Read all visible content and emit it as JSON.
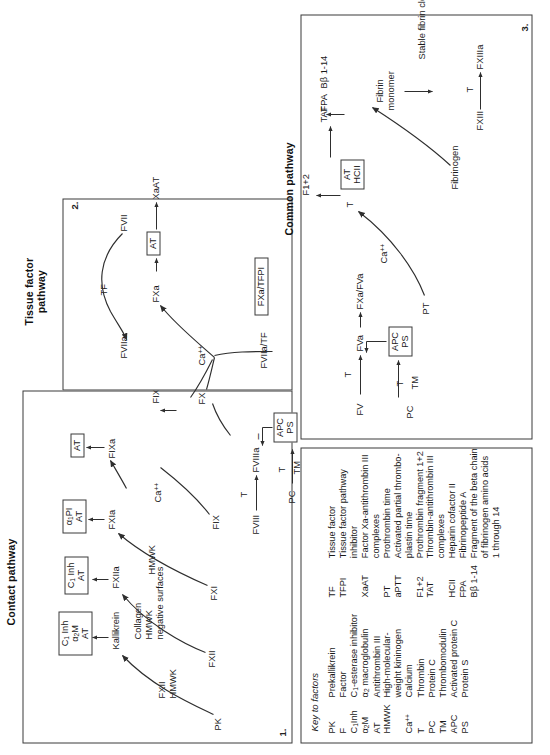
{
  "figure": {
    "title_contact": "Contact pathway",
    "title_tissue": "Tissue factor pathway",
    "title_common": "Common pathway",
    "panel_numbers": {
      "contact": "1.",
      "tissue": "2.",
      "common": "3."
    }
  },
  "contact_pathway": {
    "nodes": {
      "pk": "PK",
      "fxii_hmwk": "FXII\nHMWK",
      "kallikrein": "Kallikrein",
      "fxii": "FXII",
      "collagen_hmwk_surfaces": "Collagen\nHMWK\nnegative surfaces",
      "fxiia": "FXIIa",
      "hmwk": "HMWK",
      "fxi": "FXI",
      "fxia": "FXIa",
      "ca": "Ca",
      "ca_charge": "++",
      "fix": "FIX",
      "fixa": "FIXa",
      "fviii": "FVIII",
      "fviiia": "FVIIIa",
      "t1": "T",
      "pc": "PC",
      "t2": "T",
      "tm": "TM",
      "minus": "–",
      "fixa_fviiia": "FIXa/FVIIIa"
    },
    "inhibitor_boxes": {
      "kallikrein_inh": [
        "C₁ Inh",
        "α₂M",
        "AT"
      ],
      "fxiia_inh": [
        "C₁ Inh",
        "AT"
      ],
      "fxia_inh": [
        "α₁PI",
        "AT"
      ],
      "fixa_inh": [
        "AT"
      ],
      "apc_ps": [
        "APC",
        "PS"
      ]
    }
  },
  "tissue_factor_pathway": {
    "nodes": {
      "fvii": "FVII",
      "tf": "TF",
      "fviia": "FVIIa",
      "fviia_tf": "FVIIa/TF"
    },
    "inhibitor_boxes": {
      "fxa_tfpi": [
        "FXa/TFPI"
      ]
    }
  },
  "common_pathway": {
    "nodes": {
      "ca": "Ca",
      "ca_charge": "++",
      "fx": "FX",
      "fxa": "FXa",
      "xaat": "XaAT",
      "fv": "FV",
      "t_fv": "T",
      "fva": "FVa",
      "fxa_fva": "FXa/FVa",
      "ca2": "Ca",
      "ca2_charge": "++",
      "pt": "PT",
      "t_pt": "T",
      "f1_2": "F1+2",
      "tat": "TAT",
      "pc": "PC",
      "t_pc": "T",
      "tm": "TM",
      "fibrinogen": "Fibrinogen",
      "fpa": "FPA",
      "bb": "Bβ 1-14",
      "fibrin_monomer": "Fibrin\nmonomer",
      "fxiii": "FXIII",
      "t_fxiii": "T",
      "fxiiia": "FXIIIa",
      "stable_clot": "Stable fibrin clot"
    },
    "inhibitor_boxes": {
      "fxa_at": [
        "AT"
      ],
      "apc_ps": [
        "APC",
        "PS"
      ],
      "at_hcii": [
        "AT",
        "HCII"
      ]
    }
  },
  "key": {
    "title": "Key to factors",
    "left_column": [
      {
        "abbr": "PK",
        "desc": "Prekallikrein"
      },
      {
        "abbr": "F",
        "desc": "Factor"
      },
      {
        "abbr": "C₁Inh",
        "desc": "C₁-esterase inhibitor"
      },
      {
        "abbr": "α₂M",
        "desc": "α₂ macroglobulin"
      },
      {
        "abbr": "AT",
        "desc": "Antithrombin III"
      },
      {
        "abbr": "HMWK",
        "desc": "High-molecular-weight kininogen"
      },
      {
        "abbr": "Ca++",
        "desc": "Calcium"
      },
      {
        "abbr": "T",
        "desc": "Thrombin"
      },
      {
        "abbr": "PC",
        "desc": "Protein C"
      },
      {
        "abbr": "TM",
        "desc": "Thrombomodulin"
      },
      {
        "abbr": "APC",
        "desc": "Activated protein C"
      },
      {
        "abbr": "PS",
        "desc": "Protein S"
      }
    ],
    "right_column": [
      {
        "abbr": "TF",
        "desc": "Tissue factor"
      },
      {
        "abbr": "TFPI",
        "desc": "Tissue factor pathway inhibitor"
      },
      {
        "abbr": "XaAT",
        "desc": "Factor Xa-antithrombin III complexes"
      },
      {
        "abbr": "PT",
        "desc": "Prothrombin time"
      },
      {
        "abbr": "aPTT",
        "desc": "Activated partial thromboplastin time"
      },
      {
        "abbr": "F1+2",
        "desc": "Prothrombin fragment 1+2"
      },
      {
        "abbr": "TAT",
        "desc": "Thrombin-antithrombin III complexes"
      },
      {
        "abbr": "HCII",
        "desc": "Heparin cofactor II"
      },
      {
        "abbr": "FPA",
        "desc": "Fibrinopeptide A"
      },
      {
        "abbr": "Bβ 1-14",
        "desc": "Fragment of the beta chain of fibrinogen amino acids 1 through 14"
      }
    ]
  },
  "colors": {
    "ink": "#1a1a1a",
    "rule": "#3a3a3a",
    "stroke": "#2e2e2e",
    "paper": "#ffffff"
  }
}
